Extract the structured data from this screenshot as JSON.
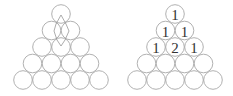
{
  "figure": {
    "left_triangle": {
      "rows": 5,
      "description": "Triangle of circles with paths drawn from the top circle down to row 3 center"
    },
    "right_triangle": {
      "rows": 5,
      "labels": [
        [
          "1"
        ],
        [
          "1",
          "1"
        ],
        [
          "1",
          "2",
          "1"
        ],
        [
          "",
          "",
          "",
          ""
        ],
        [
          "",
          "",
          "",
          "",
          ""
        ]
      ]
    }
  },
  "colors": {
    "circle_stroke": "#a8a8a8",
    "text": "#333333"
  }
}
